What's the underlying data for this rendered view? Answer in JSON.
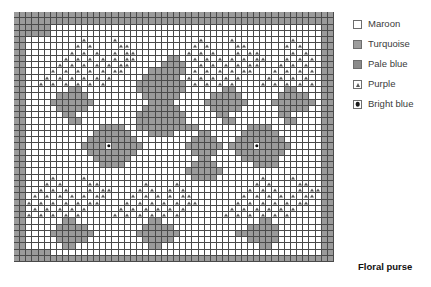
{
  "caption": "Floral purse",
  "legend": {
    "items": [
      {
        "label": "Maroon",
        "symbol": "empty-square",
        "swatch_hex": "#ffffff"
      },
      {
        "label": "Turquoise",
        "symbol": "filled-square",
        "swatch_hex": "#9d9d9d"
      },
      {
        "label": "Pale blue",
        "symbol": "filled-square",
        "swatch_hex": "#8b8b8b"
      },
      {
        "label": "Purple",
        "symbol": "triangle",
        "swatch_hex": "#ffffff"
      },
      {
        "label": "Bright blue",
        "symbol": "dot",
        "swatch_hex": "#ffffff"
      }
    ]
  },
  "chart_data": {
    "type": "heatmap",
    "title": "Floral purse",
    "xlabel": "",
    "ylabel": "",
    "grid": true,
    "legend_position": "right",
    "columns": 52,
    "rows": 40,
    "symbol_key": {
      "0": "Maroon",
      "1": "Turquoise",
      "2": "Pale blue",
      "3": "Purple",
      "4": "Bright blue"
    },
    "cells": [
      "1111111111111111111111111111111111111111111111111111",
      "1111111111111111111111111111111111111111111111111111",
      "1111110000000000000000000000000000000000000000000011",
      "1111110000000000000000000000000000000000000000000011",
      "1100000000030000300000000000003000030000000003000011",
      "1100000000303000033000000000030300003300000030300011",
      "1100000003030300303300000000303030003033000003030011",
      "1100000030303030303300000110030303030303300030303011",
      "1100000303030303033000001111003030303033000303030011",
      "1100003030303030330000111111030303030330003030303011",
      "1100030303030303000001111110303030303000030303030011",
      "1100303030303030000011111111030303030000303030303011",
      "1100000001100000000011111111000000110000000011000011",
      "1100000111110000000001111110000011111000000111110011",
      "1100001111111000000000111100000111111100001111111011",
      "1100000111110000000001111110000011111000000111110011",
      "1100000011000000000011111111000001100000000110000011",
      "1100000001100000000011111111000000110000000011000011",
      "1100000000000011110011111111110000000011110000000011",
      "1100000000000111111000111100001100000111111000000011",
      "1100000000001111111100000000011110001111111100000011",
      "1100000000011114111110000000111111011114111110000011",
      "1100000000001111111100000000011110001111111100000011",
      "1100000000000111111000000000001100000111111000000011",
      "1100000000000011110000000000011110000001111000000011",
      "1100000000000000000000000000111111000000000000000011",
      "1100003000030000000000000000011110000000300003000011",
      "1100030300003300000003000030000000000003030000330011",
      "1100303030003033000030300303000000000030303000303311",
      "1103030303030330000303030303300000000303030303033011",
      "1130303030303300003030303030330000003030303030330011",
      "1103030303030000030303030303000000030303030303000011",
      "1130303030300000303030303030000000303030303030000011",
      "1100000011000000000000110000000000000000110000000011",
      "1100000111110000000001111100000000000011111000000011",
      "1100001111111000000011111110000000001111111000000011",
      "1100000111110000000001111100000000000011111000000011",
      "1100000011000000000000110000000000000000110000000011",
      "1111110000000000000000000000000000000000000000000011",
      "1111111111111111111111111111111111111111111111111111"
    ]
  }
}
